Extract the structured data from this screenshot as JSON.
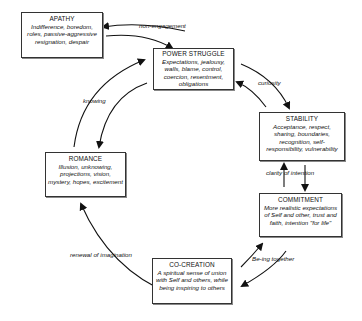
{
  "nodes": {
    "apathy": {
      "title": "APATHY",
      "desc": "Indifference, boredom, roles, passive-aggressive resignation, despair"
    },
    "power_struggle": {
      "title": "POWER STRUGGLE",
      "desc": "Expectations, jealousy, walls, blame, control, coercion, resentment, obligations"
    },
    "stability": {
      "title": "STABILITY",
      "desc": "Acceptance, respect, sharing, boundaries, recognition, self-responsibility, vulnerability"
    },
    "commitment": {
      "title": "COMMITMENT",
      "desc": "More realistic expectations of Self and other, trust and faith, intention \"for life\""
    },
    "co_creation": {
      "title": "CO-CREATION",
      "desc": "A spiritual sense of union with Self and others, while being inspiring to others"
    },
    "romance": {
      "title": "ROMANCE",
      "desc": "Illusion, unknowing, projections, vision, mystery, hopes, excitement"
    }
  },
  "edge_labels": {
    "non_engagement": "non-engagement",
    "curiosity": "curiosity",
    "clarity": "clarity of intention",
    "being_together": "Be-ing together",
    "renewal": "renewal of imagination",
    "knowing": "knowing"
  },
  "colors": {
    "line": "#111111",
    "border": "#333333",
    "background": "#ffffff"
  }
}
